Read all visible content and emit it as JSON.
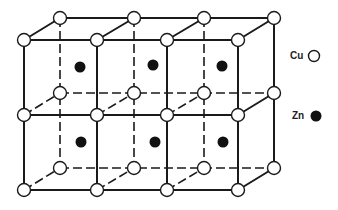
{
  "diagram": {
    "front_x": [
      24,
      97,
      167,
      238
    ],
    "back_x": [
      60,
      134,
      204,
      274
    ],
    "front_y": [
      40,
      115,
      190
    ],
    "back_y": [
      18,
      93,
      168
    ],
    "zn_positions": [
      [
        80,
        67
      ],
      [
        153,
        65
      ],
      [
        222,
        66
      ],
      [
        81,
        142
      ],
      [
        155,
        142
      ],
      [
        223,
        142
      ]
    ],
    "colors": {
      "line": "#1a1a1a",
      "cu_fill": "#ffffff",
      "zn_fill": "#111111"
    }
  },
  "legend": {
    "items": [
      {
        "label": "Cu",
        "symbol": "open-circle"
      },
      {
        "label": "Zn",
        "symbol": "filled-circle"
      }
    ]
  }
}
